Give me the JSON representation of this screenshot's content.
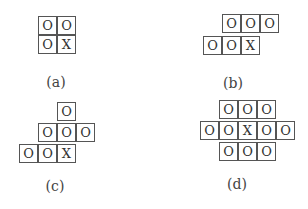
{
  "panels": [
    {
      "id": "a",
      "label": "(a)",
      "label_pos": [
        56,
        74
      ],
      "cells": [
        {
          "x": 38,
          "y": 16,
          "v": "O"
        },
        {
          "x": 57,
          "y": 16,
          "v": "O"
        },
        {
          "x": 38,
          "y": 35,
          "v": "O"
        },
        {
          "x": 57,
          "y": 35,
          "v": "X"
        }
      ]
    },
    {
      "id": "b",
      "label": "(b)",
      "label_pos": [
        233,
        75
      ],
      "cells": [
        {
          "x": 222,
          "y": 14,
          "v": "O"
        },
        {
          "x": 241,
          "y": 14,
          "v": "O"
        },
        {
          "x": 260,
          "y": 14,
          "v": "O"
        },
        {
          "x": 203,
          "y": 36,
          "v": "O"
        },
        {
          "x": 222,
          "y": 36,
          "v": "O"
        },
        {
          "x": 241,
          "y": 36,
          "v": "X"
        }
      ]
    },
    {
      "id": "c",
      "label": "(c)",
      "label_pos": [
        55,
        178
      ],
      "cells": [
        {
          "x": 57,
          "y": 102,
          "v": "O"
        },
        {
          "x": 38,
          "y": 123,
          "v": "O"
        },
        {
          "x": 57,
          "y": 123,
          "v": "O"
        },
        {
          "x": 76,
          "y": 123,
          "v": "O"
        },
        {
          "x": 19,
          "y": 144,
          "v": "O"
        },
        {
          "x": 38,
          "y": 144,
          "v": "O"
        },
        {
          "x": 57,
          "y": 144,
          "v": "X"
        }
      ]
    },
    {
      "id": "d",
      "label": "(d)",
      "label_pos": [
        237,
        176
      ],
      "cells": [
        {
          "x": 219,
          "y": 100,
          "v": "O"
        },
        {
          "x": 238,
          "y": 100,
          "v": "O"
        },
        {
          "x": 257,
          "y": 100,
          "v": "O"
        },
        {
          "x": 200,
          "y": 121,
          "v": "O"
        },
        {
          "x": 219,
          "y": 121,
          "v": "O"
        },
        {
          "x": 238,
          "y": 121,
          "v": "X"
        },
        {
          "x": 257,
          "y": 121,
          "v": "O"
        },
        {
          "x": 276,
          "y": 121,
          "v": "O"
        },
        {
          "x": 219,
          "y": 142,
          "v": "O"
        },
        {
          "x": 238,
          "y": 142,
          "v": "O"
        },
        {
          "x": 257,
          "y": 142,
          "v": "O"
        }
      ]
    }
  ]
}
